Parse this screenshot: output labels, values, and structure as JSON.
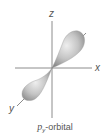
{
  "figure": {
    "axes": {
      "z_label": "z",
      "x_label": "x",
      "y_label": "y"
    },
    "caption": {
      "symbol": "p",
      "subscript": "y",
      "suffix": "-orbital"
    },
    "colors": {
      "axis": "#6e6e6e",
      "lobe_light": "#e6e6e6",
      "lobe_dark": "#8c8c8c",
      "text": "#555555"
    }
  }
}
